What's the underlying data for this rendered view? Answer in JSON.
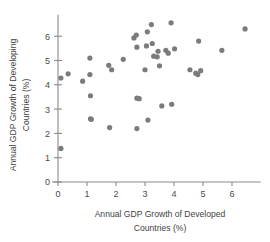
{
  "chart_data": {
    "type": "scatter",
    "title": "",
    "xlabel": "Annual GDP Growth of Developed Countries (%)",
    "ylabel": "Annual GDP Growth of Developing Countries (%)",
    "xlabel_line1": "Annual GDP Growth of Developed",
    "xlabel_line2": "Countries (%)",
    "ylabel_line1": "Annual GDP Growth of Developing",
    "ylabel_line2": "Countries (%)",
    "xlim": [
      -0.35,
      6.85
    ],
    "ylim": [
      0,
      7.0
    ],
    "xticks": [
      0,
      1,
      2,
      3,
      4,
      5,
      6
    ],
    "yticks": [
      0,
      1,
      2,
      3,
      4,
      5,
      6
    ],
    "xtick_labels": [
      "0",
      "1",
      "2",
      "3",
      "4",
      "5",
      "6"
    ],
    "ytick_labels": [
      "0",
      "1",
      "2",
      "3",
      "4",
      "5",
      "6"
    ],
    "grid": false,
    "legend": null,
    "marker_color": "#7b7b7b",
    "marker_size": 2.6,
    "points": [
      {
        "x": 0.1,
        "y": 1.38
      },
      {
        "x": 0.1,
        "y": 4.28
      },
      {
        "x": 0.35,
        "y": 4.45
      },
      {
        "x": 0.85,
        "y": 4.15
      },
      {
        "x": 1.1,
        "y": 5.1
      },
      {
        "x": 1.1,
        "y": 4.42
      },
      {
        "x": 1.12,
        "y": 3.55
      },
      {
        "x": 1.12,
        "y": 2.6
      },
      {
        "x": 1.15,
        "y": 2.58
      },
      {
        "x": 1.75,
        "y": 4.8
      },
      {
        "x": 1.85,
        "y": 4.62
      },
      {
        "x": 1.78,
        "y": 2.24
      },
      {
        "x": 2.25,
        "y": 5.05
      },
      {
        "x": 2.62,
        "y": 5.93
      },
      {
        "x": 2.7,
        "y": 6.05
      },
      {
        "x": 2.72,
        "y": 5.55
      },
      {
        "x": 2.72,
        "y": 3.45
      },
      {
        "x": 2.8,
        "y": 3.43
      },
      {
        "x": 2.72,
        "y": 2.2
      },
      {
        "x": 3.0,
        "y": 4.62
      },
      {
        "x": 3.05,
        "y": 5.6
      },
      {
        "x": 3.08,
        "y": 6.18
      },
      {
        "x": 3.1,
        "y": 2.55
      },
      {
        "x": 3.22,
        "y": 6.48
      },
      {
        "x": 3.25,
        "y": 5.7
      },
      {
        "x": 3.3,
        "y": 5.18
      },
      {
        "x": 3.42,
        "y": 5.15
      },
      {
        "x": 3.45,
        "y": 5.38
      },
      {
        "x": 3.5,
        "y": 4.78
      },
      {
        "x": 3.58,
        "y": 3.13
      },
      {
        "x": 3.72,
        "y": 5.42
      },
      {
        "x": 3.8,
        "y": 5.3
      },
      {
        "x": 3.9,
        "y": 6.55
      },
      {
        "x": 3.92,
        "y": 3.2
      },
      {
        "x": 4.02,
        "y": 5.48
      },
      {
        "x": 4.55,
        "y": 4.62
      },
      {
        "x": 4.75,
        "y": 4.48
      },
      {
        "x": 4.82,
        "y": 4.42
      },
      {
        "x": 4.92,
        "y": 4.58
      },
      {
        "x": 4.85,
        "y": 5.8
      },
      {
        "x": 5.65,
        "y": 5.42
      },
      {
        "x": 6.45,
        "y": 6.3
      }
    ]
  }
}
